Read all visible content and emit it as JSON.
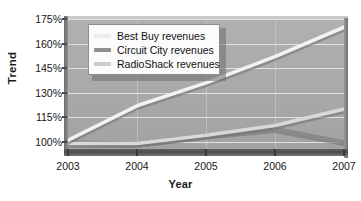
{
  "chart_data": {
    "type": "line",
    "title": "",
    "xlabel": "Year",
    "ylabel": "Trend",
    "x": [
      2003,
      2004,
      2005,
      2006,
      2007
    ],
    "x_tick_labels": [
      "2003",
      "2004",
      "2005",
      "2006",
      "2007"
    ],
    "y_tick_labels": [
      "100%",
      "115%",
      "130%",
      "145%",
      "160%",
      "175%"
    ],
    "y_ticks": [
      100,
      115,
      130,
      145,
      160,
      175
    ],
    "ylim": [
      95,
      175
    ],
    "xlim": [
      2003,
      2007
    ],
    "grid": "horizontal",
    "legend_position": "top-left-inside",
    "series": [
      {
        "name": "Best Buy revenues",
        "label": "Best Buy revenues",
        "color": "#f2f2f2",
        "values": [
          101,
          122,
          136,
          152,
          170
        ]
      },
      {
        "name": "Circuit City revenues",
        "label": "Circuit City revenues",
        "color": "#8a8a8a",
        "values": [
          100,
          99,
          104,
          108,
          100
        ]
      },
      {
        "name": "RadioShack revenues",
        "label": "RadioShack revenues",
        "color": "#d8d8d8",
        "values": [
          99,
          99,
          104,
          110,
          120
        ]
      }
    ]
  },
  "axes": {
    "y_title": "Trend",
    "x_title": "Year"
  },
  "legend": {
    "entries": [
      {
        "label": "Best Buy revenues",
        "swatch_color": "#ededed"
      },
      {
        "label": "Circuit City revenues",
        "swatch_color": "#8f8f8f"
      },
      {
        "label": "RadioShack revenues",
        "swatch_color": "#cccccc"
      }
    ]
  },
  "colors": {
    "plot_background": "#a9a9a9",
    "gridline": "#e6e6e6",
    "axis_floor": "#4d4d4d",
    "legend_background": "#fbfbfb",
    "legend_border": "#8f8f8f",
    "text": "#151515"
  }
}
